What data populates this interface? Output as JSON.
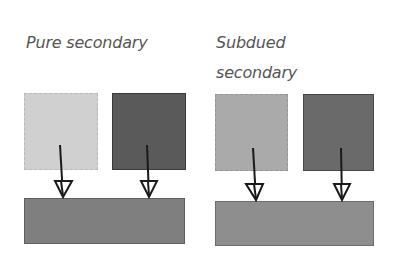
{
  "groups": [
    {
      "title_lines": [
        "Pure secondary"
      ],
      "top_swatches": [
        {
          "color": "#d0d0d0",
          "border": "#b8b8b8"
        },
        {
          "color": "#5a5a5a",
          "border": "#3a3a3a"
        }
      ],
      "result_swatch": {
        "color": "#7f7f7f",
        "border": "#5e5e5e"
      }
    },
    {
      "title_lines": [
        "Subdued",
        "secondary"
      ],
      "top_swatches": [
        {
          "color": "#aaaaaa",
          "border": "#959595"
        },
        {
          "color": "#6a6a6a",
          "border": "#474747"
        }
      ],
      "result_swatch": {
        "color": "#8e8e8e",
        "border": "#6c6c6c"
      }
    }
  ],
  "arrow_color": "#1a1a1a"
}
